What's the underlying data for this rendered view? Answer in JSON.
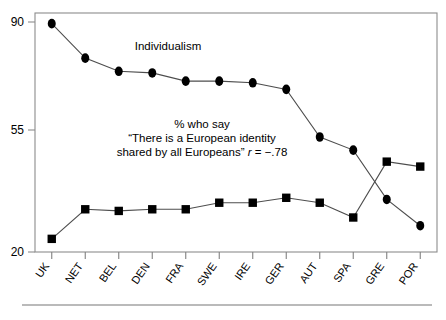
{
  "chart_data": {
    "type": "line",
    "title": "",
    "xlabel": "",
    "ylabel": "",
    "categories": [
      "UK",
      "NET",
      "BEL",
      "DEN",
      "FRA",
      "SWE",
      "IRE",
      "GER",
      "AUT",
      "SPA",
      "GRE",
      "POR"
    ],
    "ylim": [
      20,
      90
    ],
    "ytick_labels": [
      "90",
      "55",
      "20"
    ],
    "ytick_values": [
      90,
      55,
      20
    ],
    "grid": false,
    "legend_position": "inline-annotations",
    "series": [
      {
        "name": "Individualism",
        "marker": "circle",
        "values": [
          89.5,
          79.0,
          75.0,
          74.5,
          72.0,
          72.0,
          71.5,
          69.5,
          55.0,
          51.0,
          36.0,
          28.0
        ]
      },
      {
        "name": "% who say \"There is a European identity shared by all Europeans\"",
        "marker": "square",
        "values": [
          24.0,
          33.0,
          32.5,
          33.0,
          33.0,
          35.0,
          35.0,
          36.5,
          35.0,
          30.5,
          47.5,
          46.0
        ]
      }
    ],
    "annotations": [
      {
        "id": "individualism-label",
        "text": "Individualism"
      },
      {
        "id": "identity-line1",
        "text": "% who say"
      },
      {
        "id": "identity-line2",
        "text": "“There is a European identity"
      },
      {
        "id": "identity-line3a",
        "text": "shared by all Europeans” "
      },
      {
        "id": "identity-line3-r",
        "text": "r"
      },
      {
        "id": "identity-line3b",
        "text": " = −.78"
      }
    ],
    "correlation": {
      "symbol": "r",
      "value": "−.78"
    },
    "colors": {
      "marker": "#000000",
      "line": "#4d4d4d",
      "axis": "#808080",
      "background": "#ffffff"
    }
  }
}
